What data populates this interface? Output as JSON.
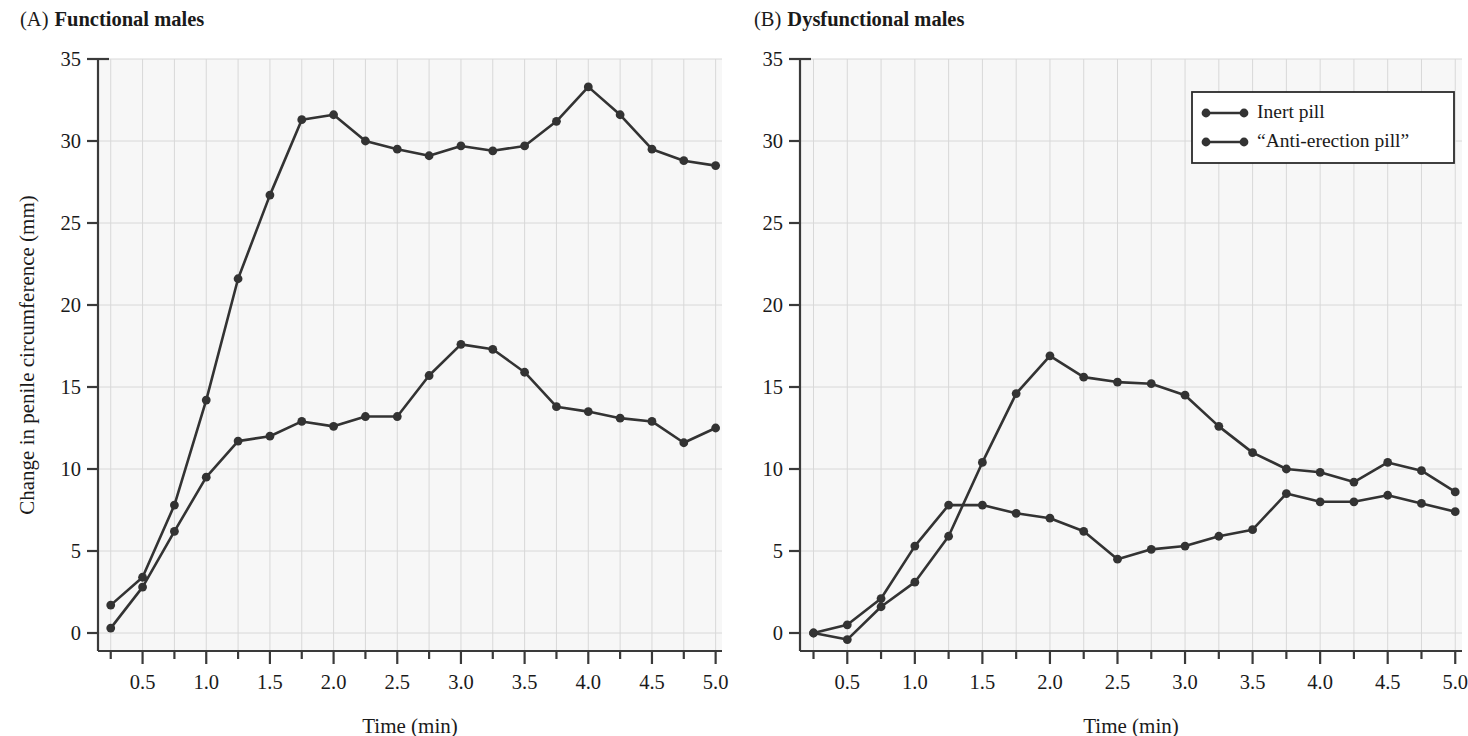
{
  "figure": {
    "panels": [
      {
        "tag": "(A)",
        "title": "Functional males"
      },
      {
        "tag": "(B)",
        "title": "Dysfunctional males"
      }
    ],
    "axis": {
      "xlabel": "Time (min)",
      "ylabel": "Change in penile circumference (mm)",
      "x_ticks": [
        "0.5",
        "1.0",
        "1.5",
        "2.0",
        "2.5",
        "3.0",
        "3.5",
        "4.0",
        "4.5",
        "5.0"
      ],
      "y_ticks": [
        "0",
        "5",
        "10",
        "15",
        "20",
        "25",
        "30",
        "35"
      ]
    },
    "legend": {
      "position": "top-right-of-panel-b",
      "entries": [
        {
          "label": "Inert pill",
          "marker": "line-with-dots",
          "color": "#333333"
        },
        {
          "label": "“Anti-erection pill”",
          "marker": "line-with-dots",
          "color": "#333333"
        }
      ]
    },
    "style": {
      "line_color": "#333333",
      "grid_color": "#d8d8d8",
      "plot_background": "#f7f7f7",
      "axis_color": "#3a3a3a"
    }
  },
  "chart_data": [
    {
      "type": "line",
      "title": "Functional males",
      "panel": "A",
      "xlabel": "Time (min)",
      "ylabel": "Change in penile circumference (mm)",
      "xlim": [
        0.15,
        5.05
      ],
      "ylim": [
        -1.5,
        35
      ],
      "grid": true,
      "x": [
        0.25,
        0.5,
        0.75,
        1.0,
        1.25,
        1.5,
        1.75,
        2.0,
        2.25,
        2.5,
        2.75,
        3.0,
        3.25,
        3.5,
        3.75,
        4.0,
        4.25,
        4.5,
        4.75,
        5.0
      ],
      "series": [
        {
          "name": "Inert pill",
          "values": [
            1.7,
            3.4,
            7.8,
            14.2,
            21.6,
            26.7,
            31.3,
            31.6,
            30.0,
            29.5,
            29.1,
            29.7,
            29.4,
            29.7,
            31.2,
            33.3,
            31.6,
            29.5,
            28.8,
            28.5
          ]
        },
        {
          "name": "“Anti-erection pill”",
          "values": [
            0.3,
            2.8,
            6.2,
            9.5,
            11.7,
            12.0,
            12.9,
            12.6,
            13.2,
            13.2,
            15.7,
            17.6,
            17.3,
            15.9,
            13.8,
            13.5,
            13.1,
            12.9,
            11.6,
            12.5
          ]
        }
      ]
    },
    {
      "type": "line",
      "title": "Dysfunctional males",
      "panel": "B",
      "xlabel": "Time (min)",
      "ylabel": "Change in penile circumference (mm)",
      "xlim": [
        0.15,
        5.05
      ],
      "ylim": [
        -1.5,
        35
      ],
      "grid": true,
      "x": [
        0.25,
        0.5,
        0.75,
        1.0,
        1.25,
        1.5,
        1.75,
        2.0,
        2.25,
        2.5,
        2.75,
        3.0,
        3.25,
        3.5,
        3.75,
        4.0,
        4.25,
        4.5,
        4.75,
        5.0
      ],
      "series": [
        {
          "name": "Inert pill",
          "values": [
            0.0,
            -0.4,
            1.6,
            3.1,
            5.9,
            10.4,
            14.6,
            16.9,
            15.6,
            15.3,
            15.2,
            14.5,
            12.6,
            11.0,
            10.0,
            9.8,
            9.2,
            10.4,
            9.9,
            8.6
          ]
        },
        {
          "name": "“Anti-erection pill”",
          "values": [
            0.0,
            0.5,
            2.1,
            5.3,
            7.8,
            7.8,
            7.3,
            7.0,
            6.2,
            4.5,
            5.1,
            5.3,
            5.9,
            6.3,
            8.5,
            8.0,
            8.0,
            8.4,
            7.9,
            7.4
          ]
        }
      ]
    }
  ]
}
